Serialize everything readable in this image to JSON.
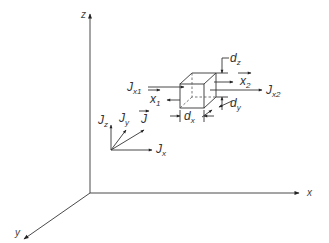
{
  "diagram": {
    "type": "3d-coordinate-flux-diagram",
    "axes": {
      "z": "z",
      "x": "x",
      "y": "y"
    },
    "vector_decomposition": {
      "total": {
        "base": "J",
        "sub": "",
        "overarrow": true
      },
      "components": [
        {
          "base": "J",
          "sub": "z"
        },
        {
          "base": "J",
          "sub": "y"
        },
        {
          "base": "J",
          "sub": "x"
        }
      ]
    },
    "volume_element": {
      "inflow": {
        "base": "J",
        "sub": "x1"
      },
      "outflow": {
        "base": "J",
        "sub": "x2"
      },
      "normals": [
        {
          "base": "x",
          "sub": "1",
          "overarrow": true
        },
        {
          "base": "x",
          "sub": "2",
          "overarrow": true
        }
      ],
      "dimensions": [
        {
          "base": "d",
          "sub": "x"
        },
        {
          "base": "d",
          "sub": "y"
        },
        {
          "base": "d",
          "sub": "z"
        }
      ]
    }
  }
}
